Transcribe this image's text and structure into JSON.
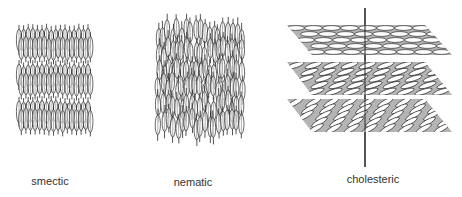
{
  "diagram": {
    "panels": [
      {
        "id": "smectic",
        "label": "smectic",
        "label_pos": {
          "x": 50,
          "y": 175
        },
        "description": "Molecules aligned vertically and arranged in stacked layers",
        "layers": 3,
        "bbox": {
          "x": 15,
          "y": 18,
          "w": 78,
          "h": 120
        }
      },
      {
        "id": "nematic",
        "label": "nematic",
        "label_pos": {
          "x": 193,
          "y": 176
        },
        "description": "Molecules aligned vertically with no positional layering",
        "bbox": {
          "x": 155,
          "y": 18,
          "w": 92,
          "h": 130
        }
      },
      {
        "id": "cholesteric",
        "label": "cholesteric",
        "label_pos": {
          "x": 373,
          "y": 173
        },
        "description": "Layered planes with molecular orientation rotating around a helical axis",
        "axis": {
          "x": 365,
          "y1": 8,
          "y2": 167
        },
        "planes": [
          {
            "name": "top-plane",
            "y": 25,
            "h": 30,
            "angle_deg": 0
          },
          {
            "name": "middle-plane",
            "y": 62,
            "h": 33,
            "angle_deg": -18
          },
          {
            "name": "bottom-plane",
            "y": 99,
            "h": 33,
            "angle_deg": -30
          }
        ]
      }
    ],
    "colors": {
      "line": "#2a2a2a",
      "plane_fill": "#b4b4b4",
      "ellipse_fill": "#ffffff",
      "label": "#333333",
      "background": "#ffffff"
    }
  }
}
